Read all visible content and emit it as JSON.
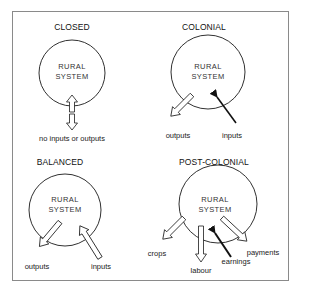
{
  "diagram": {
    "panels": [
      {
        "id": "closed",
        "title": "CLOSED",
        "system_label_line1": "RURAL",
        "system_label_line2": "SYSTEM",
        "arrows": [
          {
            "label": "no inputs or outputs",
            "direction": "bidirectional",
            "style": "outline"
          }
        ]
      },
      {
        "id": "colonial",
        "title": "COLONIAL",
        "system_label_line1": "RURAL",
        "system_label_line2": "SYSTEM",
        "arrows": [
          {
            "label": "outputs",
            "direction": "out",
            "style": "outline"
          },
          {
            "label": "inputs",
            "direction": "in",
            "style": "solid"
          }
        ]
      },
      {
        "id": "balanced",
        "title": "BALANCED",
        "system_label_line1": "RURAL",
        "system_label_line2": "SYSTEM",
        "arrows": [
          {
            "label": "outputs",
            "direction": "out",
            "style": "outline"
          },
          {
            "label": "inputs",
            "direction": "in",
            "style": "outline"
          }
        ]
      },
      {
        "id": "post-colonial",
        "title": "POST-COLONIAL",
        "system_label_line1": "RURAL",
        "system_label_line2": "SYSTEM",
        "arrows": [
          {
            "label": "crops",
            "direction": "out",
            "style": "outline"
          },
          {
            "label": "labour",
            "direction": "out",
            "style": "outline"
          },
          {
            "label": "earnings",
            "direction": "in",
            "style": "solid"
          },
          {
            "label": "payments",
            "direction": "out",
            "style": "outline"
          }
        ]
      }
    ],
    "colors": {
      "stroke": "#1a1a1a",
      "frame": "#8a8a8a",
      "background": "#ffffff"
    }
  }
}
